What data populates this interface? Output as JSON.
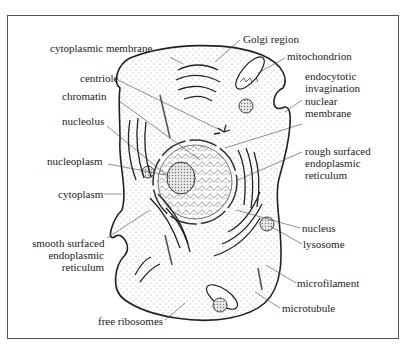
{
  "labels": {
    "cytoplasmic_membrane": "cytoplasmic membrane",
    "golgi_region": "Golgi region",
    "mitochondrion": "mitochondrion",
    "endocytotic_invagination": [
      "endocytotic",
      "invagination"
    ],
    "centriole": "centriole",
    "chromatin": "chromatin",
    "nuclear_membrane": [
      "nuclear",
      "membrane"
    ],
    "nucleolus": "nucleolus",
    "nucleoplasm": "nucleoplasm",
    "rough_er": [
      "rough surfaced",
      "endoplasmic",
      "reticulum"
    ],
    "cytoplasm": "cytoplasm",
    "nucleus": "nucleus",
    "smooth_er": [
      "smooth surfaced",
      "endoplasmic",
      "reticulum"
    ],
    "lysosome": "lysosome",
    "microfilament": "microfilament",
    "microtubule": "microtubule",
    "free_ribosomes": "free ribosomes"
  },
  "colors": {
    "line": "#222222",
    "leader": "#444444",
    "stipple": "#9a9a9a",
    "frame": "#555555"
  }
}
